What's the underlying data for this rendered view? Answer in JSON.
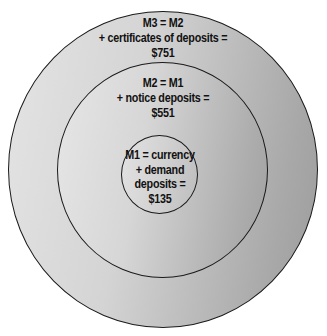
{
  "diagram": {
    "type": "nested-circles",
    "colors": {
      "outline": "#1a1a1a",
      "fill_light": "#e4e4e4",
      "fill_dark": "#9c9c9c",
      "text": "#111111"
    },
    "circles": [
      {
        "id": "M3",
        "lines": [
          "M3 = M2",
          "+ certificates of deposits =",
          "$751"
        ],
        "definition": "M2 + certificates of deposits",
        "value": "$751"
      },
      {
        "id": "M2",
        "lines": [
          "M2 = M1",
          "+ notice deposits =",
          "$551"
        ],
        "definition": "M1 + notice deposits",
        "value": "$551"
      },
      {
        "id": "M1",
        "lines": [
          "M1 = currency",
          "+ demand",
          "deposits =",
          "$135"
        ],
        "definition": "currency + demand deposits",
        "value": "$135"
      }
    ]
  }
}
